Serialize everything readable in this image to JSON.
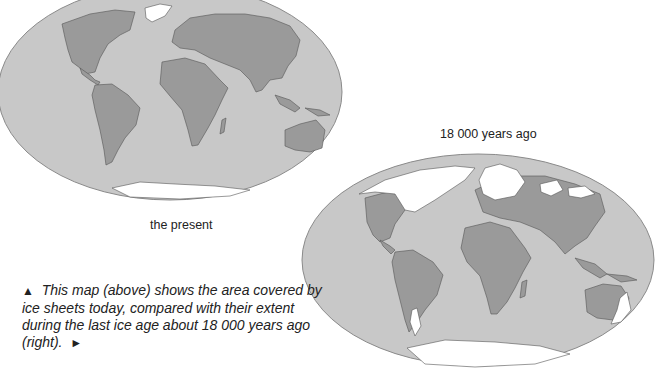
{
  "maps": [
    {
      "id": "present",
      "label": "the present",
      "ocean_color": "#c8c8c8",
      "land_color": "#9a9a9a",
      "ice_color": "#ffffff",
      "ice_regions": [
        "Greenland",
        "Antarctica"
      ]
    },
    {
      "id": "ice-age",
      "label": "18 000 years ago",
      "ocean_color": "#c8c8c8",
      "land_color": "#9a9a9a",
      "ice_color": "#ffffff",
      "ice_regions": [
        "North America (Laurentide)",
        "Greenland",
        "Scandinavia & Northern Europe",
        "Siberia patches",
        "Patagonia",
        "Southeast Australia & Tasmania",
        "New Zealand",
        "Antarctica (extended)"
      ]
    }
  ],
  "caption": {
    "lead_glyph": "▲",
    "text": "This map (above) shows the area covered by ice sheets today, compared with their extent during the last ice age about 18 000 years ago (right).",
    "trail_glyph": "►"
  }
}
